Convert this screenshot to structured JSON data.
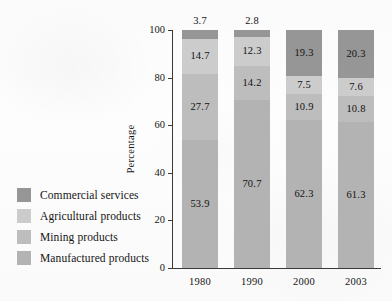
{
  "chart_data": {
    "type": "bar",
    "stacked": true,
    "title": "",
    "xlabel": "",
    "ylabel": "Percentage",
    "categories": [
      "1980",
      "1990",
      "2000",
      "2003"
    ],
    "ylim": [
      0,
      100
    ],
    "yticks": [
      "0",
      "20",
      "40",
      "60",
      "80",
      "100"
    ],
    "grid": false,
    "legend_position": "left",
    "series": [
      {
        "name": "Commercial services",
        "color": "#969696",
        "values": [
          3.7,
          2.8,
          19.3,
          20.3
        ],
        "labels": [
          "3.7",
          "2.8",
          "19.3",
          "20.3"
        ],
        "label_placement": [
          "above-bar",
          "above-bar",
          "inside",
          "inside"
        ]
      },
      {
        "name": "Agricultural products",
        "color": "#cccccc",
        "values": [
          14.7,
          12.3,
          7.5,
          7.6
        ],
        "labels": [
          "14.7",
          "12.3",
          "7.5",
          "7.6"
        ],
        "label_placement": [
          "inside",
          "inside",
          "inside",
          "inside"
        ]
      },
      {
        "name": "Mining products",
        "color": "#bdbdbd",
        "values": [
          27.7,
          14.2,
          10.9,
          10.8
        ],
        "labels": [
          "27.7",
          "14.2",
          "10.9",
          "10.8"
        ],
        "label_placement": [
          "inside",
          "inside",
          "inside",
          "inside"
        ]
      },
      {
        "name": "Manufactured products",
        "color": "#b3b3b3",
        "values": [
          53.9,
          70.7,
          62.3,
          61.3
        ],
        "labels": [
          "53.9",
          "70.7",
          "62.3",
          "61.3"
        ],
        "label_placement": [
          "inside",
          "inside",
          "inside",
          "inside"
        ]
      }
    ]
  },
  "legend": {
    "items": [
      {
        "label": "Commercial services",
        "color": "#969696"
      },
      {
        "label": "Agricultural products",
        "color": "#cccccc"
      },
      {
        "label": "Mining products",
        "color": "#bdbdbd"
      },
      {
        "label": "Manufactured products",
        "color": "#b3b3b3"
      }
    ]
  }
}
